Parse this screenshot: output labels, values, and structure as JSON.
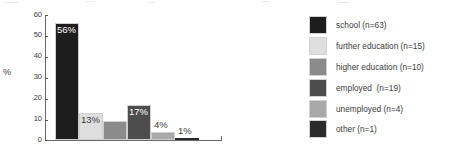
{
  "chart_data": {
    "type": "bar",
    "title": "",
    "xlabel": "",
    "ylabel": "%",
    "ylim": [
      0,
      60
    ],
    "yticks": [
      0,
      10,
      20,
      30,
      40,
      50,
      60
    ],
    "ytick_labels": [
      "0",
      "10",
      "20",
      "30",
      "40",
      "50",
      "60"
    ],
    "grid": false,
    "legend_position": "right",
    "categories": [
      "school (n=63)",
      "further education (n=15)",
      "higher education (n=10)",
      "employed  (n=19)",
      "unemployed (n=4)",
      "other (n=1)"
    ],
    "values": [
      56,
      13,
      9,
      17,
      4,
      1
    ],
    "data_labels": [
      "56%",
      "13%",
      "9%",
      "17%",
      "4%",
      "1%"
    ],
    "series": [
      {
        "name": "",
        "values": [
          56,
          13,
          9,
          17,
          4,
          1
        ]
      }
    ],
    "colors": [
      "#1d1d1d",
      "#dedede",
      "#8b8b8b",
      "#4d4d4d",
      "#a9a9a9",
      "#2b2b2b"
    ],
    "label_colors": [
      "#ffffff",
      "#3b3b3b",
      "#ffffff",
      "#ffffff",
      "#3b3b3b",
      "#3b3b3b"
    ]
  },
  "axis": {
    "y_title": "%",
    "ticks": [
      {
        "label": "60"
      },
      {
        "label": "50"
      },
      {
        "label": "40"
      },
      {
        "label": "30"
      },
      {
        "label": "20"
      },
      {
        "label": "10"
      },
      {
        "label": "0"
      }
    ]
  },
  "bars": [
    {
      "label": "56%",
      "value": 56,
      "color": "#1d1d1d",
      "label_color": "#ffffff"
    },
    {
      "label": "13%",
      "value": 13,
      "color": "#dedede",
      "label_color": "#3b3b3b"
    },
    {
      "label": "9%",
      "value": 9,
      "color": "#8b8b8b",
      "label_color": "#ffffff"
    },
    {
      "label": "17%",
      "value": 17,
      "color": "#4d4d4d",
      "label_color": "#ffffff"
    },
    {
      "label": "4%",
      "value": 4,
      "color": "#a9a9a9",
      "label_color": "#3b3b3b"
    },
    {
      "label": "1%",
      "value": 1,
      "color": "#2b2b2b",
      "label_color": "#3b3b3b"
    }
  ],
  "legend": {
    "items": [
      {
        "label": "school (n=63)",
        "color": "#1d1d1d"
      },
      {
        "label": "further education (n=15)",
        "color": "#dedede"
      },
      {
        "label": "higher education (n=10)",
        "color": "#8b8b8b"
      },
      {
        "label": "employed  (n=19)",
        "color": "#4d4d4d"
      },
      {
        "label": "unemployed (n=4)",
        "color": "#a9a9a9"
      },
      {
        "label": "other (n=1)",
        "color": "#2b2b2b"
      }
    ]
  }
}
